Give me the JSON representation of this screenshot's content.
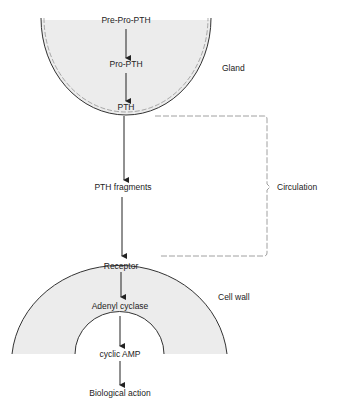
{
  "diagram": {
    "colors": {
      "fill": "#ececec",
      "stroke": "#333333",
      "dashed": "#888888",
      "text": "#222222"
    },
    "gland": {
      "label": "Gland",
      "steps": [
        "Pre-Pro-PTH",
        "Pro-PTH",
        "PTH"
      ]
    },
    "circulation": {
      "label": "Circulation",
      "fragments_label": "PTH fragments"
    },
    "cell": {
      "label": "Cell wall",
      "steps": [
        "Receptor",
        "Adenyl cyclase",
        "cyclic AMP",
        "Biological action"
      ]
    }
  }
}
